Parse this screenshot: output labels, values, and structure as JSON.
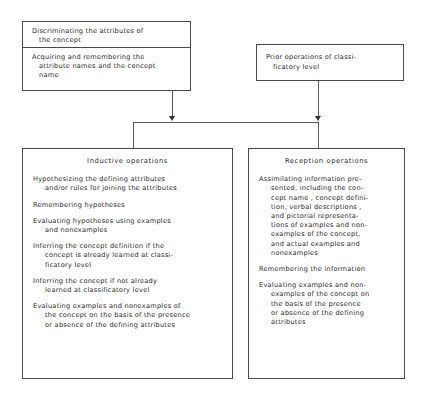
{
  "diagram": {
    "type": "flowchart",
    "title": "",
    "top_boxes": [
      {
        "name": "discrimination-box",
        "sections": [
          {
            "text": "Discriminating the attributes of\n   the concept"
          },
          {
            "text": "Acquiring and remembering the\n   attribute names and the concept\n   name"
          }
        ]
      },
      {
        "name": "prior-operations-box",
        "sections": [
          {
            "text": "Prior operations of classi-\n   ficatory level"
          }
        ]
      }
    ],
    "bottom_panels": [
      {
        "name": "inductive-operations-panel",
        "title": "Inductive operations",
        "items": [
          "Hypothesizing the defining attributes\nand/or rules for joining the attributes",
          "Remembering hypotheses",
          "Evaluating hypotheses using examples\nand nonexamples",
          "Inferring the concept definition if the\nconcept is already learned at classi-\nficatory level",
          "Inferring the concept if not already\nlearned at classificatory level",
          "Evaluating examples and nonexamples of\nthe concept on the basis of the presence\nor absence of the defining attributes"
        ]
      },
      {
        "name": "reception-operations-panel",
        "title": "Reception operations",
        "items": [
          "Assimilating information pre-\nsented, including the con-\ncept name , concept defini-\ntion, verbal descriptions ,\nand pictorial representa-\ntions of examples and non-\nexamples of the concept,\nand actual examples and\nnonexamples",
          "Remembering the information",
          "Evaluating examples and non-\nexamples of the concept on\nthe basis of the presence\nor absence of the defining\nattributes"
        ]
      }
    ],
    "connectors": {
      "arrow_count": 2,
      "style": "bracket-junction"
    },
    "colors": {
      "background": "#ffffff",
      "border": "#4a4a4a",
      "connector": "#5a5a5a",
      "text": "#2b2b2b"
    }
  }
}
